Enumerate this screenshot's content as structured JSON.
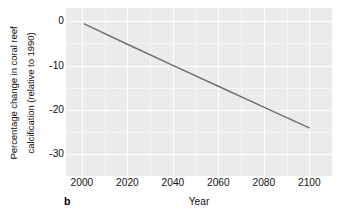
{
  "chart_data": {
    "type": "line",
    "title": "",
    "subtitle": "",
    "panel_label": "b",
    "xlabel": "Year",
    "ylabel_line1": "Percentage change in coral reef",
    "ylabel_line2": "calcification (relative to 1990)",
    "xlim": [
      1993,
      2110
    ],
    "ylim": [
      -35,
      3
    ],
    "xticks": [
      2000,
      2020,
      2040,
      2060,
      2080,
      2100
    ],
    "xtick_labels": [
      "2000",
      "2020",
      "2040",
      "2060",
      "2080",
      "2100"
    ],
    "yticks": [
      0,
      -10,
      -20,
      -30
    ],
    "ytick_labels": [
      "0",
      "-10",
      "-20",
      "-30"
    ],
    "x_minor_ticks": [
      2010,
      2030,
      2050,
      2070,
      2090
    ],
    "y_minor_ticks": [
      -5,
      -15,
      -25
    ],
    "grid": true,
    "legend": "none",
    "series": [
      {
        "name": "Coral reef calcification change",
        "color": "#6e6e6e",
        "line_width": 1.4,
        "x": [
          2001,
          2020,
          2040,
          2060,
          2080,
          2100
        ],
        "values": [
          -0.6,
          -5.2,
          -10.0,
          -14.7,
          -19.4,
          -24.1
        ]
      }
    ],
    "panel_background": "#ebebeb",
    "gridline_color": "#ffffff",
    "minor_gridline_color": "#f6f6f6",
    "axis_text_color": "#111111"
  }
}
